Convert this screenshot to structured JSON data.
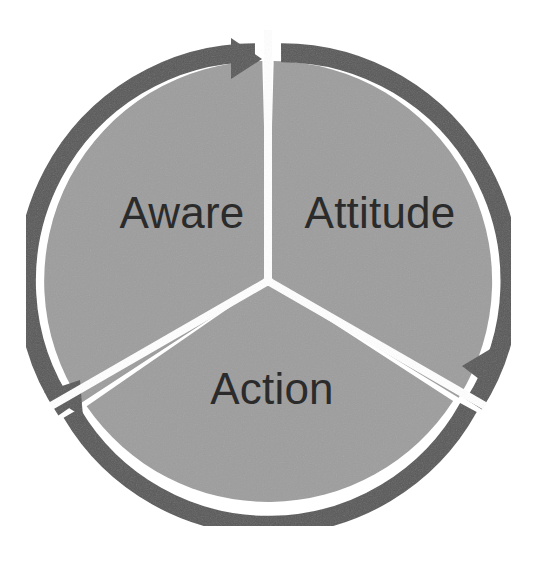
{
  "diagram": {
    "type": "cycle-diagram",
    "direction": "clockwise",
    "segment_count": 3,
    "colors": {
      "background": "#ffffff",
      "segment_fill": "#9d9d9d",
      "arrow_ring": "#585858",
      "divider": "#ffffff",
      "label_text": "#2b2b2b"
    },
    "geometry": {
      "center_x": 268,
      "center_y": 281,
      "outer_radius": 238,
      "pie_radius": 220,
      "ring_thickness": 19,
      "gap_degrees": 3
    },
    "segments": [
      {
        "id": "aware",
        "label": "Aware",
        "order": 1,
        "start_angle_deg": -90,
        "end_angle_deg": 30,
        "label_x": 182,
        "label_y": 228,
        "arrow_position": "top"
      },
      {
        "id": "attitude",
        "label": "Attitude",
        "order": 2,
        "start_angle_deg": 30,
        "end_angle_deg": 150,
        "label_x": 380,
        "label_y": 228,
        "arrow_position": "right"
      },
      {
        "id": "action",
        "label": "Action",
        "order": 3,
        "start_angle_deg": 150,
        "end_angle_deg": 270,
        "label_x": 272,
        "label_y": 404,
        "arrow_position": "bottom-left"
      }
    ]
  }
}
